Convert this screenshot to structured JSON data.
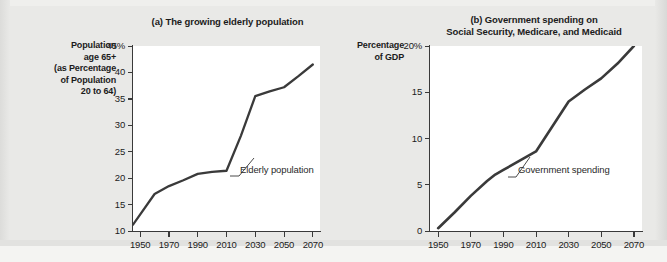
{
  "figure": {
    "background_color": "#e9e9e7",
    "line_color": "#3a3a3a",
    "plot_background": "#ffffff"
  },
  "chart_data": [
    {
      "type": "line",
      "panel": "a",
      "title": "(a) The growing elderly population",
      "ylabel": "Population age 65+ (as Percentage of Population 20 to 64)",
      "ylabel_lines": [
        "Population",
        "age 65+",
        "(as Percentage",
        "of Population",
        "20 to 64)"
      ],
      "xlabel": "",
      "ylim": [
        10,
        45
      ],
      "xlim": [
        1945,
        2075
      ],
      "ytick_labels": [
        "45%",
        "40",
        "35",
        "30",
        "25",
        "20",
        "15",
        "10"
      ],
      "ytick_values": [
        45,
        40,
        35,
        30,
        25,
        20,
        15,
        10
      ],
      "xtick_labels": [
        "1950",
        "1970",
        "1990",
        "2010",
        "2030",
        "2050",
        "2070"
      ],
      "xtick_values": [
        1950,
        1970,
        1990,
        2010,
        2030,
        2050,
        2070
      ],
      "grid": false,
      "legend": "none",
      "series": [
        {
          "name": "Elderly population",
          "x": [
            1945,
            1960,
            1970,
            1980,
            1990,
            2000,
            2010,
            2020,
            2030,
            2040,
            2050,
            2060,
            2070
          ],
          "values": [
            11.2,
            17.0,
            18.5,
            19.6,
            20.8,
            21.2,
            21.4,
            28.0,
            35.5,
            36.4,
            37.2,
            39.3,
            41.5
          ]
        }
      ],
      "annotations": [
        {
          "text": "Elderly population",
          "x": 2012,
          "y": 21.6
        }
      ]
    },
    {
      "type": "line",
      "panel": "b",
      "title": "(b) Government spending on Social Security, Medicare, and Medicaid",
      "title_lines": [
        "(b) Government spending on",
        "Social Security, Medicare, and Medicaid"
      ],
      "ylabel": "Percentage of GDP",
      "ylabel_lines": [
        "Percentage",
        "of GDP"
      ],
      "xlabel": "",
      "ylim": [
        0,
        20
      ],
      "xlim": [
        1945,
        2075
      ],
      "ytick_labels": [
        "20%",
        "15",
        "10",
        "5",
        "0"
      ],
      "ytick_values": [
        20,
        15,
        10,
        5,
        0
      ],
      "xtick_labels": [
        "1950",
        "1970",
        "1990",
        "2010",
        "2030",
        "2050",
        "2070"
      ],
      "xtick_values": [
        1950,
        1970,
        1990,
        2010,
        2030,
        2050,
        2070
      ],
      "grid": false,
      "legend": "none",
      "series": [
        {
          "name": "Government spending",
          "x": [
            1950,
            1960,
            1970,
            1980,
            1985,
            1990,
            2000,
            2010,
            2020,
            2030,
            2040,
            2050,
            2060,
            2070
          ],
          "values": [
            0.3,
            2.0,
            3.8,
            5.4,
            6.1,
            6.6,
            7.6,
            8.6,
            11.3,
            14.0,
            15.3,
            16.5,
            18.1,
            20.0
          ]
        }
      ],
      "annotations": [
        {
          "text": "Government spending",
          "x": 2012,
          "y": 8.1
        }
      ]
    }
  ]
}
